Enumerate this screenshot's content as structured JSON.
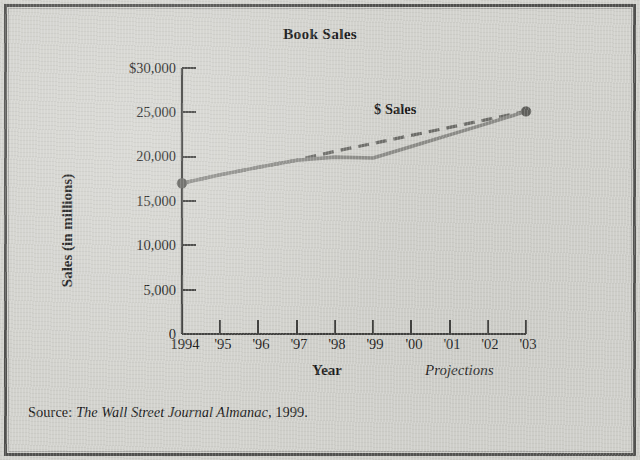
{
  "figure": {
    "title": "Book Sales",
    "source_prefix": "Source:",
    "source_italic": "The Wall Street Journal Almanac",
    "source_suffix": ", 1999."
  },
  "axes": {
    "y_title": "Sales (in millions)",
    "x_title": "Year",
    "projections_label": "Projections",
    "y_tick_labels": [
      "$30,000",
      "25,000",
      "20,000",
      "15,000",
      "10,000",
      "5,000",
      "0"
    ],
    "x_tick_labels": [
      "1994",
      "'95",
      "'96",
      "'97",
      "'98",
      "'99",
      "'00",
      "'01",
      "'02",
      "'03"
    ]
  },
  "legend": {
    "series_label": "$ Sales"
  },
  "colors": {
    "background": "#d2d2cd",
    "border": "#4f4f4d",
    "axis": "#3a3a38",
    "series_solid": "#8a8a86",
    "series_dashed": "#6a6a66",
    "marker": "#5d5d59",
    "text": "#161616"
  },
  "chart_data": {
    "type": "line",
    "title": "Book Sales",
    "xlabel": "Year",
    "ylabel": "Sales (in millions)",
    "xlim": [
      1994,
      2003
    ],
    "ylim": [
      0,
      30000
    ],
    "ytick_values": [
      0,
      5000,
      10000,
      15000,
      20000,
      25000,
      30000
    ],
    "ytick_labels": [
      "0",
      "5,000",
      "10,000",
      "15,000",
      "20,000",
      "25,000",
      "$30,000"
    ],
    "x": [
      1994,
      1995,
      1996,
      1997,
      1998,
      1999,
      2000,
      2001,
      2002,
      2003
    ],
    "xtick_labels": [
      "1994",
      "'95",
      "'96",
      "'97",
      "'98",
      "'99",
      "'00",
      "'01",
      "'02",
      "'03"
    ],
    "grid": false,
    "legend_position": "inline-annotation",
    "annotations": [
      {
        "text": "$ Sales",
        "x": 1999.1,
        "y": 25300
      },
      {
        "text": "Projections",
        "x": 2001.6,
        "y": -4200
      }
    ],
    "series": [
      {
        "name": "$ Sales (actual)",
        "style": "solid",
        "color": "#8a8a86",
        "markers_at": [
          1994,
          2003
        ],
        "values": [
          17000,
          17950,
          18800,
          19600,
          19950,
          19850,
          21150,
          22450,
          23750,
          25100
        ]
      },
      {
        "name": "$ Sales (projected trend)",
        "style": "dashed",
        "color": "#6a6a66",
        "x_start": 1994,
        "x_end": 2003,
        "values": [
          17000,
          17950,
          18800,
          19600,
          20600,
          21500,
          22400,
          23300,
          24200,
          25100
        ]
      }
    ]
  }
}
